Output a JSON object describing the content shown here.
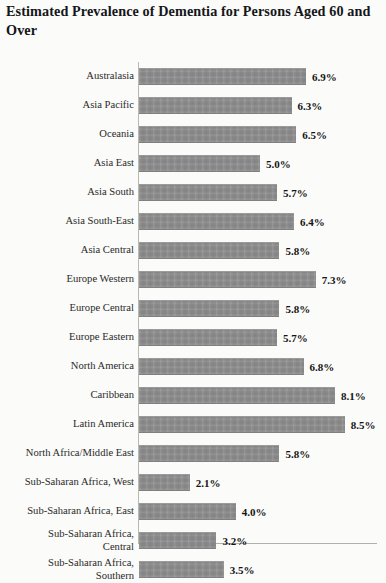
{
  "chart_data": {
    "type": "bar",
    "orientation": "horizontal",
    "title": "Estimated Prevalence of Dementia for Persons Aged 60 and Over",
    "xlabel": "",
    "ylabel": "",
    "unit": "%",
    "grid": false,
    "legend": "none",
    "xlim": [
      0,
      9.8
    ],
    "categories": [
      "Australasia",
      "Asia Pacific",
      "Oceania",
      "Asia East",
      "Asia South",
      "Asia South-East",
      "Asia Central",
      "Europe Western",
      "Europe Central",
      "Europe Eastern",
      "North America",
      "Caribbean",
      "Latin America",
      "North Africa/Middle East",
      "Sub-Saharan Africa, West",
      "Sub-Saharan Africa, East",
      "Sub-Saharan Africa,\nCentral",
      "Sub-Saharan Africa,\nSouthern"
    ],
    "values": [
      6.9,
      6.3,
      6.5,
      5.0,
      5.7,
      6.4,
      5.8,
      7.3,
      5.8,
      5.7,
      6.8,
      8.1,
      8.5,
      5.8,
      2.1,
      4.0,
      3.2,
      3.5
    ],
    "data_labels": [
      "6.9%",
      "6.3%",
      "6.5%",
      "5.0%",
      "5.7%",
      "6.4%",
      "5.8%",
      "7.3%",
      "5.8%",
      "5.7%",
      "6.8%",
      "8.1%",
      "8.5%",
      "5.8%",
      "2.1%",
      "4.0%",
      "3.2%",
      "3.5%"
    ],
    "bar_color": "#8d8d8d",
    "axis_color": "#b9b9b4",
    "background_color": "#fbfbf9"
  },
  "scale": {
    "px_per_unit": 24.2
  }
}
